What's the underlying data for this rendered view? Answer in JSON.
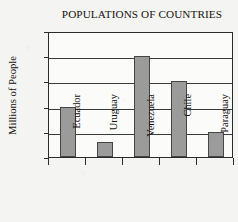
{
  "chart_data": {
    "type": "bar",
    "title": "POPULATIONS OF COUNTRIES",
    "xlabel": "",
    "ylabel": "Millions of People",
    "categories": [
      "Ecuador",
      "Uruguay",
      "Venezuela",
      "Chile",
      "Paraguay"
    ],
    "values": [
      10,
      3,
      20,
      15,
      5
    ],
    "ylim": [
      0,
      25
    ],
    "ytick_labels": [
      "0",
      "5",
      "10",
      "15",
      "20",
      "25"
    ],
    "ytick_values": [
      0,
      5,
      10,
      15,
      20,
      25
    ],
    "grid": "horizontal",
    "legend": "none",
    "bar_color": "#9b9b9b",
    "bar_edge_color": "#454545",
    "axis_color": "#2b2b2b",
    "background_color": "#f4f4f2",
    "plot_background_color": "#fbfbfa",
    "text_color": "#14110f",
    "series": [
      {
        "name": "Population",
        "values": [
          10,
          3,
          20,
          15,
          5
        ]
      }
    ]
  }
}
